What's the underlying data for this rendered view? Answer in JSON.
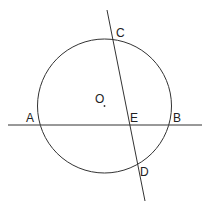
{
  "diagram": {
    "type": "geometry",
    "labels": {
      "A": "A",
      "B": "B",
      "C": "C",
      "D": "D",
      "E": "E",
      "O": "O"
    },
    "colors": {
      "stroke": "#333333",
      "text": "#222222",
      "background": "#ffffff"
    }
  }
}
